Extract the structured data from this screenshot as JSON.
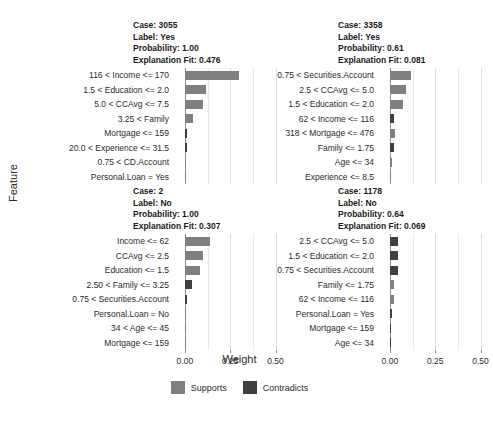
{
  "figure": {
    "xlabel": "Weight",
    "ylabel": "Feature"
  },
  "legend": {
    "items": [
      {
        "label": "Supports",
        "color": "#7f7f7f"
      },
      {
        "label": "Contradicts",
        "color": "#404040"
      }
    ]
  },
  "axis": {
    "ticks": [
      "0.00",
      "0.25",
      "0.50"
    ],
    "tick_values": [
      0.0,
      0.25,
      0.5
    ],
    "xlim": [
      -0.06,
      0.58
    ]
  },
  "chart_data": {
    "type": "bar",
    "title": "",
    "xlabel": "Weight",
    "ylabel": "Feature",
    "xlim": [
      -0.06,
      0.58
    ],
    "xticks": [
      0.0,
      0.25,
      0.5
    ],
    "xticklabels": [
      "0.00",
      "0.25",
      "0.50"
    ],
    "grid": true,
    "legend": [
      "Supports",
      "Contradicts"
    ],
    "legend_position": "bottom",
    "panels": [
      {
        "case": "3055",
        "label": "Yes",
        "probability": "1.00",
        "explanation_fit": "0.476",
        "header": {
          "case_line": "Case: 3055",
          "label_line": "Label: Yes",
          "probability_line": "Probability: 1.00",
          "fit_line": "Explanation Fit: 0.476"
        },
        "features": [
          {
            "label": "116 < Income <= 170",
            "weight": 0.3,
            "type": "supports"
          },
          {
            "label": "1.5 < Education <= 2.0",
            "weight": 0.118,
            "type": "supports"
          },
          {
            "label": "5.0 < CCAvg <= 7.5",
            "weight": 0.1,
            "type": "supports"
          },
          {
            "label": "3.25 < Family",
            "weight": 0.045,
            "type": "supports"
          },
          {
            "label": "Mortgage <= 159",
            "weight": 0.012,
            "type": "contradicts"
          },
          {
            "label": "20.0 < Experience <= 31.5",
            "weight": 0.01,
            "type": "contradicts"
          },
          {
            "label": "0.75 < CD.Account",
            "weight": 0.006,
            "type": "supports"
          },
          {
            "label": "Personal.Loan = Yes",
            "weight": 0.004,
            "type": "supports"
          }
        ]
      },
      {
        "case": "3358",
        "label": "Yes",
        "probability": "0.61",
        "explanation_fit": "0.081",
        "header": {
          "case_line": "Case: 3358",
          "label_line": "Label: Yes",
          "probability_line": "Probability: 0.61",
          "fit_line": "Explanation Fit: 0.081"
        },
        "features": [
          {
            "label": "0.75 < Securities.Account",
            "weight": 0.118,
            "type": "supports"
          },
          {
            "label": "2.5 < CCAvg <= 5.0",
            "weight": 0.088,
            "type": "supports"
          },
          {
            "label": "1.5 < Education <= 2.0",
            "weight": 0.07,
            "type": "supports"
          },
          {
            "label": "62 < Income <= 116",
            "weight": 0.024,
            "type": "contradicts"
          },
          {
            "label": "318 < Mortgage <= 476",
            "weight": 0.026,
            "type": "supports"
          },
          {
            "label": "Family <= 1.75",
            "weight": 0.024,
            "type": "contradicts"
          },
          {
            "label": "Age <= 34",
            "weight": 0.011,
            "type": "supports"
          },
          {
            "label": "Experience <= 8.5",
            "weight": 0.003,
            "type": "supports"
          }
        ]
      },
      {
        "case": "2",
        "label": "No",
        "probability": "1.00",
        "explanation_fit": "0.307",
        "header": {
          "case_line": "Case: 2",
          "label_line": "Label: No",
          "probability_line": "Probability: 1.00",
          "fit_line": "Explanation Fit: 0.307"
        },
        "features": [
          {
            "label": "Income <= 62",
            "weight": 0.14,
            "type": "supports"
          },
          {
            "label": "CCAvg <= 2.5",
            "weight": 0.1,
            "type": "supports"
          },
          {
            "label": "Education <= 1.5",
            "weight": 0.085,
            "type": "supports"
          },
          {
            "label": "2.50 < Family <= 3.25",
            "weight": 0.038,
            "type": "contradicts"
          },
          {
            "label": "0.75 < Securities.Account",
            "weight": 0.01,
            "type": "contradicts"
          },
          {
            "label": "Personal.Loan = No",
            "weight": 0.004,
            "type": "supports"
          },
          {
            "label": "34 < Age <= 45",
            "weight": 0.004,
            "type": "supports"
          },
          {
            "label": "Mortgage <= 159",
            "weight": 0.003,
            "type": "supports"
          }
        ]
      },
      {
        "case": "1178",
        "label": "No",
        "probability": "0.64",
        "explanation_fit": "0.069",
        "header": {
          "case_line": "Case: 1178",
          "label_line": "Label: No",
          "probability_line": "Probability: 0.64",
          "fit_line": "Explanation Fit: 0.069"
        },
        "features": [
          {
            "label": "2.5 < CCAvg <= 5.0",
            "weight": 0.044,
            "type": "contradicts"
          },
          {
            "label": "1.5 < Education <= 2.0",
            "weight": 0.044,
            "type": "contradicts"
          },
          {
            "label": "0.75 < Securities.Account",
            "weight": 0.044,
            "type": "contradicts"
          },
          {
            "label": "Family <= 1.75",
            "weight": 0.022,
            "type": "supports"
          },
          {
            "label": "62 < Income <= 116",
            "weight": 0.022,
            "type": "supports"
          },
          {
            "label": "Personal.Loan = Yes",
            "weight": 0.013,
            "type": "contradicts"
          },
          {
            "label": "Mortgage <= 159",
            "weight": 0.005,
            "type": "contradicts"
          },
          {
            "label": "Age <= 34",
            "weight": 0.003,
            "type": "contradicts"
          }
        ]
      }
    ]
  }
}
